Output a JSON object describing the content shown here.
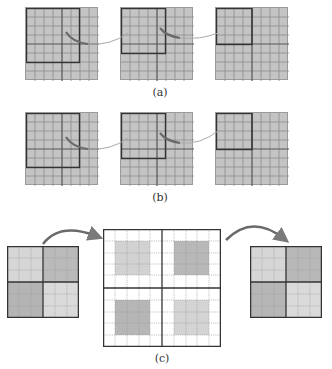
{
  "figure": {
    "panels": [
      {
        "id": "a",
        "caption": "(a)",
        "grids": [
          {
            "x": 25,
            "y": 7,
            "size": 73,
            "highlight": {
              "x0": 0,
              "y0": 0,
              "x1": 6,
              "y1": 6
            }
          },
          {
            "x": 120,
            "y": 7,
            "size": 73,
            "highlight": {
              "x0": 0,
              "y0": 0,
              "x1": 5,
              "y1": 5
            }
          },
          {
            "x": 215,
            "y": 7,
            "size": 73,
            "highlight": {
              "x0": 0,
              "y0": 0,
              "x1": 4,
              "y1": 4
            }
          }
        ]
      },
      {
        "id": "b",
        "caption": "(b)",
        "grids": [
          {
            "x": 25,
            "y": 112,
            "size": 73,
            "highlight": {
              "x0": 0,
              "y0": 0,
              "x1": 6,
              "y1": 6
            }
          },
          {
            "x": 120,
            "y": 112,
            "size": 73,
            "highlight": {
              "x0": 0,
              "y0": 0,
              "x1": 5,
              "y1": 5
            }
          },
          {
            "x": 215,
            "y": 112,
            "size": 73,
            "highlight": {
              "x0": 0,
              "y0": 0,
              "x1": 4,
              "y1": 4
            }
          }
        ]
      },
      {
        "id": "c",
        "caption": "(c)",
        "small_left": {
          "x": 7,
          "y": 246,
          "size": 72
        },
        "large_center": {
          "x": 103,
          "y": 229,
          "size": 118
        },
        "small_right": {
          "x": 250,
          "y": 246,
          "size": 72
        }
      }
    ],
    "colors": {
      "cell_fill": "#c4c4c4",
      "grid_line": "#8a8a8a",
      "bold_line": "#555555",
      "arrow": "#7a7a7a",
      "quad_light": "#d8d8d8",
      "quad_dark": "#b4b4b4"
    }
  }
}
